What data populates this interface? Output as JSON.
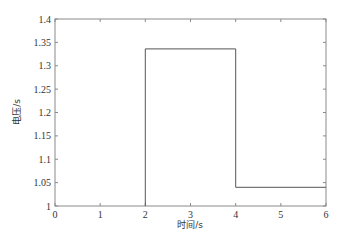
{
  "chart_data": {
    "type": "line",
    "subtype": "step",
    "title": "",
    "xlabel": "时间/s",
    "ylabel": "电压/s",
    "xlim": [
      0,
      6
    ],
    "ylim": [
      1,
      1.4
    ],
    "xticks": [
      0,
      1,
      2,
      3,
      4,
      5,
      6
    ],
    "xtick_labels": [
      "0",
      "1",
      "2",
      "3",
      "4",
      "5",
      "6"
    ],
    "yticks": [
      1,
      1.05,
      1.1,
      1.15,
      1.2,
      1.25,
      1.3,
      1.35,
      1.4
    ],
    "ytick_labels": [
      "1",
      "1.05",
      "1.1",
      "1.15",
      "1.2",
      "1.25",
      "1.3",
      "1.35",
      "1.4"
    ],
    "grid": false,
    "legend": null,
    "series": [
      {
        "name": "voltage",
        "color": "#555555",
        "x": [
          2,
          2,
          4,
          4,
          6
        ],
        "y": [
          1.0,
          1.336,
          1.336,
          1.04,
          1.04
        ]
      }
    ]
  },
  "colors": {
    "axis": "#888888",
    "line": "#555555",
    "text": "#333333",
    "background": "#ffffff"
  }
}
